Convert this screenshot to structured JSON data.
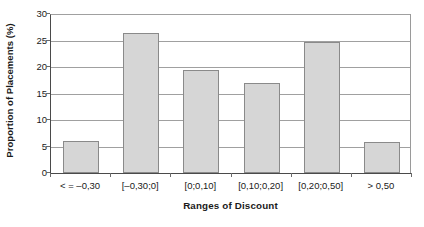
{
  "chart_data": {
    "type": "bar",
    "title": "",
    "xlabel": "Ranges of Discount",
    "ylabel": "Proportion of Placements (%)",
    "categories": [
      "< = –0,30",
      "[–0,30;0]",
      "[0;0,10]",
      "[0,10;0,20]",
      "[0,20;0,50]",
      "> 0,50"
    ],
    "values": [
      6.1,
      26.5,
      19.5,
      16.9,
      24.7,
      5.8
    ],
    "ylim": [
      0,
      30
    ],
    "yticks": [
      0,
      5,
      10,
      15,
      20,
      25,
      30
    ],
    "ytick_labels": [
      "0",
      "5",
      "10",
      "15",
      "20",
      "25",
      "30"
    ],
    "grid": "horizontal",
    "legend": "none",
    "bar_fill": "#d6d6d6",
    "bar_edge": "#8a8a8a",
    "axis_color": "#4a4a4a",
    "grid_color": "#a0a0a0",
    "background": "#ffffff"
  }
}
